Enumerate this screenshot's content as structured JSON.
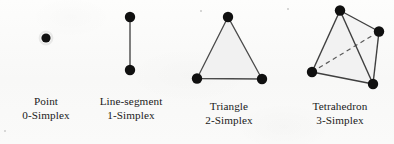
{
  "figure": {
    "title": "",
    "background_color": "#fbfbfa",
    "ink_color": "#111111",
    "fill_color": "#f1f1f1",
    "edge_color": "#3c3c3c"
  },
  "items": [
    {
      "name": "point",
      "line1": "Point",
      "line2": "0-Simplex",
      "vertices": 1,
      "edges": 0
    },
    {
      "name": "line-segment",
      "line1": "Line-segment",
      "line2": "1-Simplex",
      "vertices": 2,
      "edges": 1
    },
    {
      "name": "triangle",
      "line1": "Triangle",
      "line2": "2-Simplex",
      "vertices": 3,
      "edges": 3
    },
    {
      "name": "tetrahedron",
      "line1": "Tetrahedron",
      "line2": "3-Simplex",
      "vertices": 4,
      "edges": 6
    }
  ]
}
